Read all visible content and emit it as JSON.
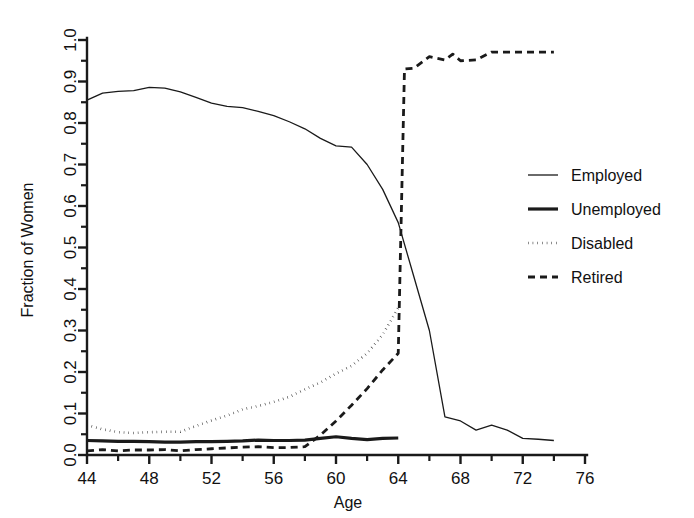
{
  "chart_data": {
    "type": "line",
    "title": "",
    "xlabel": "Age",
    "ylabel": "Fraction of Women",
    "xlim": [
      44,
      76
    ],
    "ylim": [
      0.0,
      1.0
    ],
    "grid": false,
    "legend_position": "right-middle",
    "x_major_ticks": [
      44,
      48,
      52,
      56,
      60,
      64,
      68,
      72,
      76
    ],
    "x_major_tick_labels": [
      "44",
      "48",
      "52",
      "56",
      "60",
      "64",
      "68",
      "72",
      "76"
    ],
    "x_minor_tick_step": 2,
    "y_major_ticks": [
      0.0,
      0.1,
      0.2,
      0.3,
      0.4,
      0.5,
      0.6,
      0.7,
      0.8,
      0.9,
      1.0
    ],
    "y_major_tick_labels": [
      "0.0",
      "0.1",
      "0.2",
      "0.3",
      "0.4",
      "0.5",
      "0.6",
      "0.7",
      "0.8",
      "0.9",
      "1.0"
    ],
    "y_minor_tick_step": 0.05,
    "series": [
      {
        "name": "Employed",
        "style": "solid-thin",
        "stroke_width": 1.3,
        "dash": "none",
        "x": [
          44,
          45,
          46,
          47,
          48,
          49,
          50,
          51,
          52,
          53,
          54,
          55,
          56,
          57,
          58,
          59,
          60,
          61,
          62,
          63,
          64,
          65,
          66,
          67,
          68,
          69,
          70,
          71,
          72,
          73,
          74
        ],
        "values": [
          0.855,
          0.872,
          0.876,
          0.878,
          0.886,
          0.884,
          0.875,
          0.862,
          0.848,
          0.84,
          0.837,
          0.828,
          0.818,
          0.803,
          0.786,
          0.763,
          0.745,
          0.742,
          0.7,
          0.64,
          0.56,
          0.43,
          0.3,
          0.092,
          0.082,
          0.06,
          0.072,
          0.06,
          0.04,
          0.038,
          0.035
        ]
      },
      {
        "name": "Unemployed",
        "style": "solid-thick",
        "stroke_width": 3.2,
        "dash": "none",
        "x": [
          44,
          45,
          46,
          47,
          48,
          49,
          50,
          51,
          52,
          53,
          54,
          55,
          56,
          57,
          58,
          59,
          60,
          61,
          62,
          63,
          64
        ],
        "values": [
          0.035,
          0.034,
          0.033,
          0.033,
          0.032,
          0.031,
          0.031,
          0.032,
          0.032,
          0.033,
          0.034,
          0.036,
          0.035,
          0.035,
          0.036,
          0.04,
          0.044,
          0.04,
          0.037,
          0.04,
          0.041
        ]
      },
      {
        "name": "Disabled",
        "style": "dotted",
        "stroke_width": 2.6,
        "dash": "0.5,4.2",
        "x": [
          44,
          45,
          46,
          47,
          48,
          49,
          50,
          51,
          52,
          53,
          54,
          55,
          56,
          57,
          58,
          59,
          60,
          61,
          62,
          63,
          64
        ],
        "values": [
          0.072,
          0.062,
          0.055,
          0.053,
          0.055,
          0.056,
          0.056,
          0.07,
          0.083,
          0.095,
          0.11,
          0.118,
          0.128,
          0.14,
          0.158,
          0.175,
          0.196,
          0.215,
          0.245,
          0.29,
          0.355
        ]
      },
      {
        "name": "Retired",
        "style": "dashed",
        "stroke_width": 2.8,
        "dash": "7,5",
        "x": [
          44,
          45,
          46,
          47,
          48,
          49,
          50,
          51,
          52,
          53,
          54,
          55,
          56,
          57,
          58,
          59,
          60,
          61,
          62,
          63,
          64,
          64.4,
          65,
          66,
          67,
          67.5,
          68,
          69,
          70,
          71,
          72,
          73,
          74
        ],
        "values": [
          0.01,
          0.013,
          0.01,
          0.012,
          0.012,
          0.013,
          0.01,
          0.013,
          0.015,
          0.017,
          0.019,
          0.02,
          0.018,
          0.018,
          0.02,
          0.048,
          0.082,
          0.12,
          0.16,
          0.205,
          0.245,
          0.93,
          0.932,
          0.96,
          0.952,
          0.966,
          0.95,
          0.952,
          0.971,
          0.971,
          0.971,
          0.971,
          0.971
        ]
      }
    ]
  },
  "legend": {
    "entries": [
      {
        "label": "Employed",
        "style": "solid-thin"
      },
      {
        "label": "Unemployed",
        "style": "solid-thick"
      },
      {
        "label": "Disabled",
        "style": "dotted"
      },
      {
        "label": "Retired",
        "style": "dashed"
      }
    ]
  },
  "colors": {
    "ink": "#1a1a1a",
    "background": "#ffffff"
  }
}
